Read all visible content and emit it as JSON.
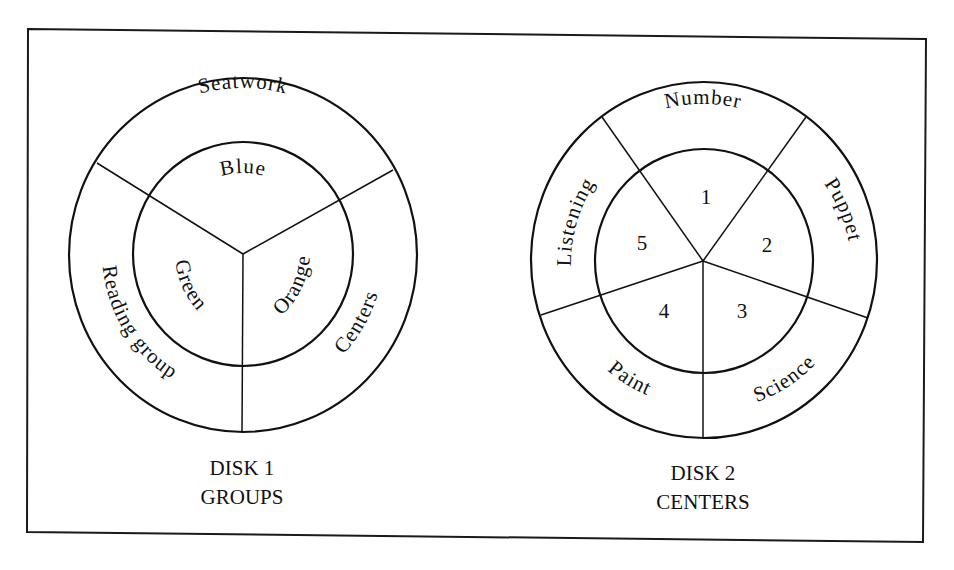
{
  "figure": {
    "disk1": {
      "outer_segments": [
        {
          "label": "Seatwork"
        },
        {
          "label": "Centers"
        },
        {
          "label": "Reading group"
        }
      ],
      "inner_segments": [
        {
          "label": "Blue"
        },
        {
          "label": "Orange"
        },
        {
          "label": "Green"
        }
      ],
      "caption_line1": "DISK 1",
      "caption_line2": "GROUPS"
    },
    "disk2": {
      "outer_segments": [
        {
          "label": "Number"
        },
        {
          "label": "Puppet"
        },
        {
          "label": "Science"
        },
        {
          "label": "Paint"
        },
        {
          "label": "Listening"
        }
      ],
      "inner_segments": [
        {
          "label": "1"
        },
        {
          "label": "2"
        },
        {
          "label": "3"
        },
        {
          "label": "4"
        },
        {
          "label": "5"
        }
      ],
      "caption_line1": "DISK 2",
      "caption_line2": "CENTERS"
    },
    "colors": {
      "line": "#111111",
      "background": "#ffffff"
    }
  }
}
